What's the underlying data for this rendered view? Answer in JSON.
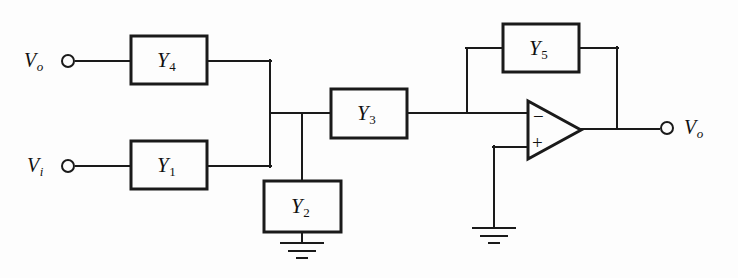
{
  "diagram": {
    "background_color": "#fdfdfd",
    "line_color": "#1a1a1a"
  },
  "blocks": [
    {
      "id": "Y4",
      "base": "Y",
      "sub": "4",
      "x": 131,
      "y": 36,
      "w": 76,
      "h": 48
    },
    {
      "id": "Y1",
      "base": "Y",
      "sub": "1",
      "x": 131,
      "y": 141,
      "w": 76,
      "h": 48
    },
    {
      "id": "Y2",
      "base": "Y",
      "sub": "2",
      "x": 264,
      "y": 181,
      "w": 77,
      "h": 51
    },
    {
      "id": "Y3",
      "base": "Y",
      "sub": "3",
      "x": 331,
      "y": 89,
      "w": 76,
      "h": 49
    },
    {
      "id": "Y5",
      "base": "Y",
      "sub": "5",
      "x": 503,
      "y": 24,
      "w": 76,
      "h": 48
    }
  ],
  "terminals": [
    {
      "id": "vo_in",
      "base": "V",
      "sub": "o",
      "cx": 68,
      "cy": 61,
      "label_x": 24,
      "label_y": 49
    },
    {
      "id": "vi_in",
      "base": "V",
      "sub": "i",
      "cx": 68,
      "cy": 166,
      "label_x": 27,
      "label_y": 154
    },
    {
      "id": "vo_out",
      "base": "V",
      "sub": "o",
      "cx": 667,
      "cy": 128,
      "label_x": 684,
      "label_y": 116
    }
  ],
  "opamp": {
    "inverting_sign": "−",
    "noninverting_sign": "+",
    "apex_x": 581,
    "top_y": 101,
    "bottom_y": 159,
    "left_x": 528,
    "out_y": 130
  },
  "grounds": [
    {
      "id": "gnd_y2",
      "x": 302,
      "y": 232
    },
    {
      "id": "gnd_opamp",
      "x": 494,
      "y": 228
    }
  ],
  "nodes": {
    "bus_x": 270,
    "y2_drop_x": 302,
    "y3_in_y": 113,
    "feedback_drop_x": 467,
    "output_tap_x": 617
  }
}
